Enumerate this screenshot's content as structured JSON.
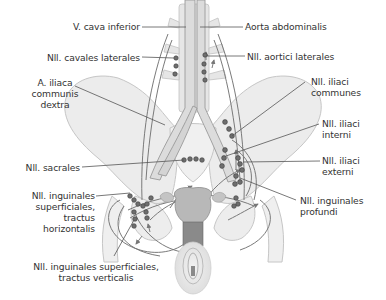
{
  "figure": {
    "colors": {
      "background": "#ffffff",
      "bone_fill": "#ececec",
      "bone_stroke": "#c6c6c6",
      "vessel_fill": "#dcdcdc",
      "vessel_stroke": "#9a9a9a",
      "node_fill": "#6e6e6e",
      "node_stroke": "#3c3c3c",
      "lymph_path": "#7a7a7a",
      "leader_line": "#555555",
      "organ_fill": "#b8b8b8",
      "organ_dark": "#888888",
      "vulva_fill": "#e6e6e6",
      "text": "#333333"
    }
  },
  "labels": {
    "v_cava_inferior": "V. cava inferior",
    "aorta_abdominalis": "Aorta abdominalis",
    "nll_cavales_laterales": "Nll. cavales laterales",
    "nll_aortici_laterales": "Nll. aortici laterales",
    "a_iliaca_communis_dextra": [
      "A. iliaca",
      "communis",
      "dextra"
    ],
    "nll_iliaci_communes": [
      "Nll. iliaci",
      "communes"
    ],
    "nll_iliaci_interni": [
      "Nll. iliaci",
      "interni"
    ],
    "nll_sacrales": "Nll. sacrales",
    "nll_iliaci_externi": [
      "Nll. iliaci",
      "externi"
    ],
    "nll_inguinales_superficiales_horizontalis": [
      "Nll. inguinales",
      "superficiales,",
      "tractus",
      "horizontalis"
    ],
    "nll_inguinales_profundi": [
      "Nll. inguinales",
      "profundi"
    ],
    "nll_inguinales_superficiales_verticalis": [
      "Nll. inguinales superficiales,",
      "tractus verticalis"
    ]
  }
}
